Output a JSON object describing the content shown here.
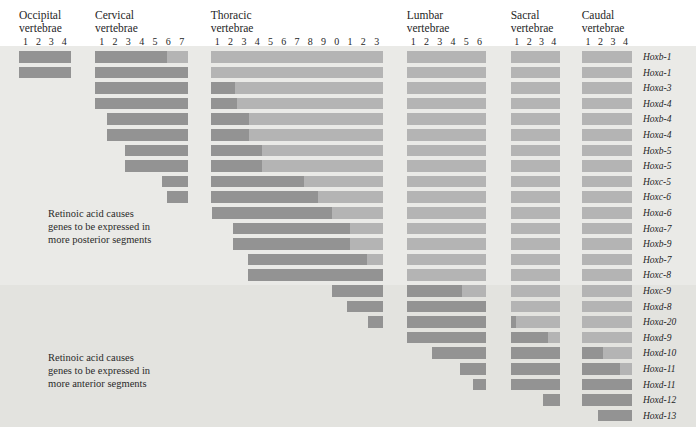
{
  "figure": {
    "background_color": "#eaeae7",
    "lower_band_color": "#e3e3df",
    "strong_color": "#939393",
    "weak_color": "#b4b4b4"
  },
  "annotations": [
    {
      "id": "posterior-note",
      "lines": [
        "Retinoic acid causes",
        "genes to be expressed in",
        "more posterior segments"
      ]
    },
    {
      "id": "anterior-note",
      "lines": [
        "Retinoic acid causes",
        "genes to be expressed in",
        "more anterior segments"
      ]
    }
  ],
  "chart_data": {
    "type": "bar",
    "title": "",
    "xlabel": "",
    "ylabel": "",
    "orientation": "horizontal",
    "grid": false,
    "legend": [],
    "axis_note": "Columns are individual vertebrae grouped by axial region; rows are Hox genes. Dark segment = strong expression domain, light segment = weaker expression extending posteriorly.",
    "regions": [
      {
        "name_lines": [
          "Occipital",
          "vertebrae"
        ],
        "labels": [
          "1",
          "2",
          "3",
          "4"
        ]
      },
      {
        "name_lines": [
          "Cervical",
          "vertebrae"
        ],
        "labels": [
          "1",
          "2",
          "3",
          "4",
          "5",
          "6",
          "7"
        ]
      },
      {
        "name_lines": [
          "Thoracic",
          "vertebrae"
        ],
        "labels": [
          "1",
          "2",
          "3",
          "4",
          "5",
          "6",
          "7",
          "8",
          "9",
          "0",
          "1",
          "2",
          "3"
        ]
      },
      {
        "name_lines": [
          "Lumbar",
          "vertebrae"
        ],
        "labels": [
          "1",
          "2",
          "3",
          "4",
          "5",
          "6"
        ]
      },
      {
        "name_lines": [
          "Sacral",
          "vertebrae"
        ],
        "labels": [
          "1",
          "2",
          "3",
          "4"
        ]
      },
      {
        "name_lines": [
          "Caudal",
          "vertebrae"
        ],
        "labels": [
          "1",
          "2",
          "3",
          "4"
        ]
      }
    ],
    "total_columns": 38,
    "genes": [
      {
        "name": "Hoxb-1",
        "start": 0.0,
        "strong_end": 9.4,
        "end": 38
      },
      {
        "name": "Hoxa-1",
        "start": 0.0,
        "strong_end": 11.0,
        "end": 38
      },
      {
        "name": "Hoxa-3",
        "start": 4.0,
        "strong_end": 12.85,
        "end": 38
      },
      {
        "name": "Hoxd-4",
        "start": 4.0,
        "strong_end": 13.0,
        "end": 38
      },
      {
        "name": "Hoxb-4",
        "start": 4.9,
        "strong_end": 13.85,
        "end": 38
      },
      {
        "name": "Hoxa-4",
        "start": 4.9,
        "strong_end": 13.85,
        "end": 38
      },
      {
        "name": "Hoxb-5",
        "start": 6.25,
        "strong_end": 14.85,
        "end": 38
      },
      {
        "name": "Hoxa-5",
        "start": 6.25,
        "strong_end": 14.85,
        "end": 38
      },
      {
        "name": "Hoxc-5",
        "start": 9.0,
        "strong_end": 18.0,
        "end": 38
      },
      {
        "name": "Hoxc-6",
        "start": 9.4,
        "strong_end": 19.1,
        "end": 38
      },
      {
        "name": "Hoxa-6",
        "start": 11.07,
        "strong_end": 20.1,
        "end": 38
      },
      {
        "name": "Hoxa-7",
        "start": 12.66,
        "strong_end": 21.5,
        "end": 38
      },
      {
        "name": "Hoxb-9",
        "start": 12.66,
        "strong_end": 21.5,
        "end": 38
      },
      {
        "name": "Hoxb-7",
        "start": 13.79,
        "strong_end": 22.75,
        "end": 38
      },
      {
        "name": "Hoxc-8",
        "start": 13.79,
        "strong_end": 24.0,
        "end": 38
      },
      {
        "name": "Hoxc-9",
        "start": 20.1,
        "strong_end": 28.16,
        "end": 38
      },
      {
        "name": "Hoxd-8",
        "start": 21.24,
        "strong_end": 30.0,
        "end": 38
      },
      {
        "name": "Hoxa-20",
        "start": 22.87,
        "strong_end": 30.4,
        "end": 38
      },
      {
        "name": "Hoxd-9",
        "start": 24.0,
        "strong_end": 33.05,
        "end": 38
      },
      {
        "name": "Hoxd-10",
        "start": 25.9,
        "strong_end": 35.73,
        "end": 38
      },
      {
        "name": "Hoxa-11",
        "start": 28.0,
        "strong_end": 37.06,
        "end": 38
      },
      {
        "name": "Hoxd-11",
        "start": 29.0,
        "strong_end": 38.0,
        "end": 38
      },
      {
        "name": "Hoxd-12",
        "start": 32.65,
        "strong_end": 38.0,
        "end": 38
      },
      {
        "name": "Hoxd-13",
        "start": 35.33,
        "strong_end": 38.0,
        "end": 38
      }
    ]
  }
}
